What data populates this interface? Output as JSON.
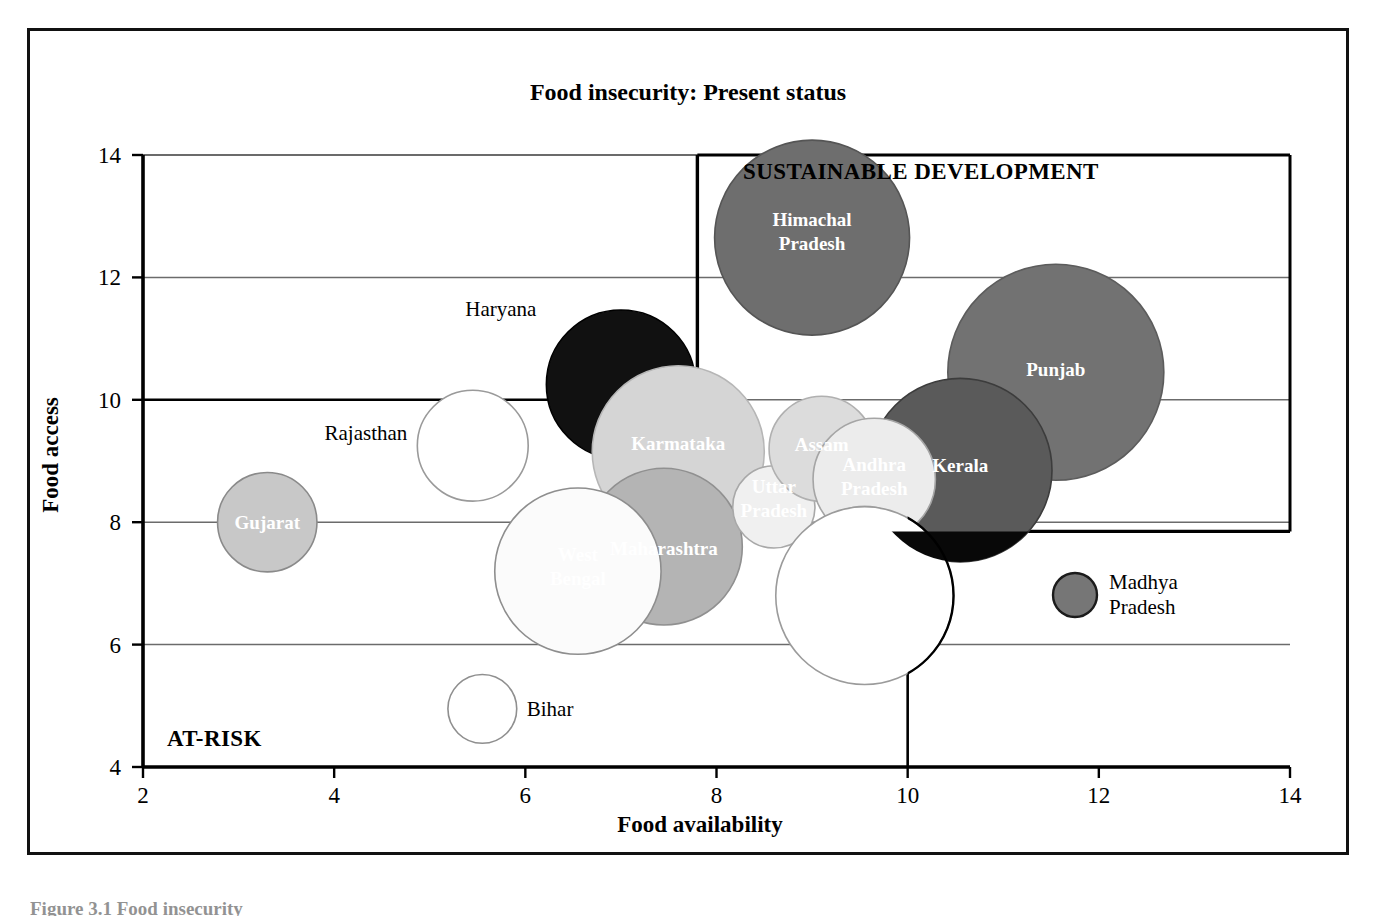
{
  "figure": {
    "title": "Food insecurity: Present status",
    "caption_partial": "Figure 3.1  Food insecurity"
  },
  "chart_data": {
    "type": "scatter",
    "title": "Food insecurity: Present status",
    "xlabel": "Food availability",
    "ylabel": "Food access",
    "xlim": [
      2,
      14
    ],
    "ylim": [
      4,
      14
    ],
    "xticks": [
      2,
      4,
      6,
      8,
      10,
      12,
      14
    ],
    "yticks": [
      4,
      6,
      8,
      10,
      12,
      14
    ],
    "grid": true,
    "legend_position": "inside-right",
    "annotations": [
      {
        "text": "SUSTAINABLE DEVELOPMENT",
        "x": 12.0,
        "y": 13.6
      },
      {
        "text": "AT-RISK",
        "x": 2.25,
        "y": 4.35
      }
    ],
    "zones": [
      {
        "name": "sustainable-development",
        "x0": 7.8,
        "x1": 14.0,
        "y0": 7.85,
        "y1": 14.0
      },
      {
        "name": "at-risk",
        "x0": 2.0,
        "x1": 10.0,
        "y0": 4.0,
        "y1": 10.0
      }
    ],
    "points": [
      {
        "label": "Himachal Pradesh",
        "x": 9.0,
        "y": 12.65,
        "r": 1.02,
        "fill": "#6e6e6e",
        "stroke": "#555555",
        "label_position": "inside",
        "label_color": "#ffffff"
      },
      {
        "label": "Punjab",
        "x": 11.55,
        "y": 10.45,
        "r": 1.13,
        "fill": "#727272",
        "stroke": "#5c5c5c",
        "label_position": "inside",
        "label_color": "#ffffff"
      },
      {
        "label": "Kerala",
        "x": 10.55,
        "y": 8.85,
        "r": 0.96,
        "fill": "#5a5a5a",
        "stroke": "#3c3c3c",
        "label_position": "inside",
        "label_color": "#ffffff"
      },
      {
        "label": "Haryana",
        "x": 7.0,
        "y": 10.25,
        "r": 0.78,
        "fill": "#111111",
        "stroke": "#000000",
        "label_position": "left",
        "label_color": "#000000"
      },
      {
        "label": "Rajasthan",
        "x": 5.45,
        "y": 9.25,
        "r": 0.58,
        "fill": "#ffffff",
        "stroke": "#9a9a9a",
        "label_position": "left",
        "label_color": "#000000"
      },
      {
        "label": "Karmataka",
        "x": 7.6,
        "y": 9.15,
        "r": 0.9,
        "fill": "#d5d5d5",
        "stroke": "#b6b6b6",
        "label_position": "inside",
        "label_color": "#000000"
      },
      {
        "label": "Maharashtra",
        "x": 7.45,
        "y": 7.6,
        "r": 0.82,
        "fill": "#b4b4b4",
        "stroke": "#909090",
        "label_position": "inside",
        "label_color": "#000000"
      },
      {
        "label": "West Bengal",
        "x": 6.55,
        "y": 7.2,
        "r": 0.87,
        "fill": "#fbfbfb",
        "stroke": "#8e8e8e",
        "label_position": "inside",
        "label_color": "#000000"
      },
      {
        "label": "Uttar Pradesh",
        "x": 8.6,
        "y": 8.25,
        "r": 0.43,
        "fill": "#f0f0f0",
        "stroke": "#a8a8a8",
        "label_position": "inside",
        "label_color": "#000000"
      },
      {
        "label": "Assam",
        "x": 9.1,
        "y": 9.2,
        "r": 0.55,
        "fill": "#dcdcdc",
        "stroke": "#b0b0b0",
        "label_position": "inside",
        "label_color": "#000000"
      },
      {
        "label": "Andhra Pradesh",
        "x": 9.65,
        "y": 8.7,
        "r": 0.64,
        "fill": "#ececec",
        "stroke": "#a5a5a5",
        "label_position": "inside",
        "label_color": "#000000"
      },
      {
        "label": "Orissa",
        "x": 9.55,
        "y": 7.4,
        "r": 0.55,
        "fill": "#e2e2e2",
        "stroke": "#aaaaaa",
        "label_position": "inside",
        "label_color": "#000000"
      },
      {
        "label": "Tamil Nadu",
        "x": 9.55,
        "y": 6.8,
        "r": 0.93,
        "fill": "#ffffff",
        "stroke": "#9b9b9b",
        "label_position": "inside",
        "label_color": "#000000"
      },
      {
        "label": "Gujarat",
        "x": 3.3,
        "y": 8.0,
        "r": 0.52,
        "fill": "#c8c8c8",
        "stroke": "#8a8a8a",
        "label_position": "inside",
        "label_color": "#000000"
      },
      {
        "label": "Bihar",
        "x": 5.55,
        "y": 4.95,
        "r": 0.36,
        "fill": "#ffffff",
        "stroke": "#8f8f8f",
        "label_position": "right",
        "label_color": "#000000"
      }
    ],
    "legend": [
      {
        "label": "Madhya Pradesh",
        "fill": "#767676",
        "stroke": "#1b1b1b"
      }
    ]
  },
  "colors": {
    "frame": "#111111",
    "axis": "#000000",
    "grid": "#6b6b6b",
    "background": "#ffffff"
  }
}
